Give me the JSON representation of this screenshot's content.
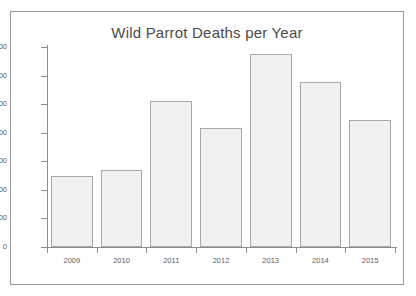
{
  "chart_data": {
    "type": "bar",
    "title": "Wild Parrot Deaths per Year",
    "xlabel": "",
    "ylabel": "",
    "categories": [
      "2009",
      "2010",
      "2011",
      "2012",
      "2013",
      "2014",
      "2015"
    ],
    "values": [
      250,
      268,
      510,
      418,
      675,
      577,
      446
    ],
    "ylim": [
      0,
      700
    ],
    "yticks": [
      0,
      100,
      200,
      300,
      400,
      500,
      600,
      700
    ],
    "ytick_labels": [
      "0",
      "100",
      "200",
      "300",
      "400",
      "500",
      "600",
      "700"
    ],
    "grid": false,
    "legend": null,
    "colors": {
      "bar_fill": "#f1f1f1",
      "bar_border": "#a8a8a8",
      "axis": "#8d8d8d",
      "text": "#5d5d5d",
      "title_text": "#4a4a4a",
      "frame_border": "#9a9a9a",
      "background": "#ffffff"
    }
  }
}
